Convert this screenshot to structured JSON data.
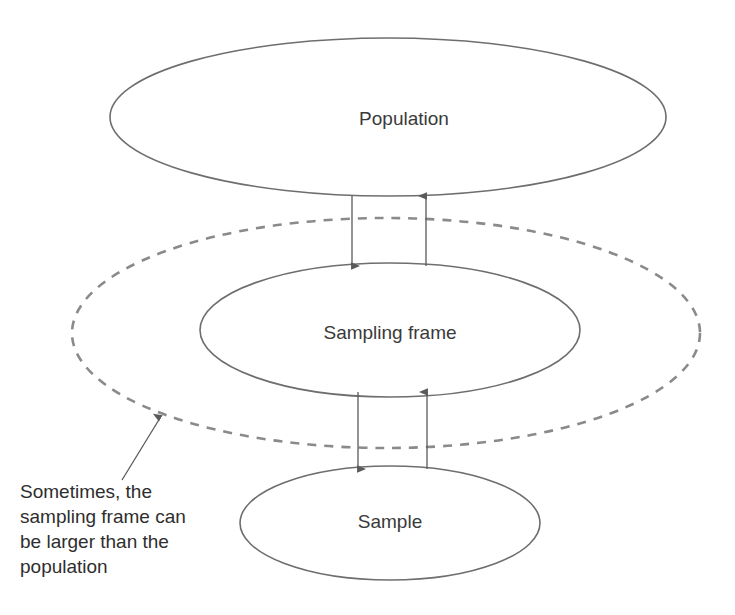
{
  "diagram": {
    "nodes": [
      {
        "id": "population",
        "label": "Population",
        "shape": "ellipse",
        "style": "solid",
        "cx": 388,
        "cy": 117,
        "rx": 278,
        "ry": 79,
        "label_x": 404,
        "label_y": 120
      },
      {
        "id": "sampling-frame-outer",
        "label": "",
        "shape": "ellipse",
        "style": "dashed",
        "cx": 386,
        "cy": 333,
        "rx": 314,
        "ry": 115,
        "label_x": 386,
        "label_y": 333
      },
      {
        "id": "sampling-frame",
        "label": "Sampling frame",
        "shape": "ellipse",
        "style": "solid",
        "cx": 390,
        "cy": 330,
        "rx": 190,
        "ry": 67,
        "label_x": 390,
        "label_y": 334
      },
      {
        "id": "sample",
        "label": "Sample",
        "shape": "ellipse",
        "style": "solid",
        "cx": 390,
        "cy": 523,
        "rx": 150,
        "ry": 57,
        "label_x": 390,
        "label_y": 523
      }
    ],
    "connectors": [
      {
        "id": "population-to-sampling-frame",
        "from": "population",
        "to": "sampling-frame",
        "direction": "down",
        "x": 352,
        "y_start": 196,
        "y_end": 266
      },
      {
        "id": "sampling-frame-to-population",
        "from": "sampling-frame",
        "to": "population",
        "direction": "up",
        "x": 426,
        "y_start": 266,
        "y_end": 196
      },
      {
        "id": "sampling-frame-to-sample",
        "from": "sampling-frame",
        "to": "sample",
        "direction": "down",
        "x": 358,
        "y_start": 392,
        "y_end": 469
      },
      {
        "id": "sample-to-sampling-frame",
        "from": "sample",
        "to": "sampling-frame",
        "direction": "up",
        "x": 427,
        "y_start": 469,
        "y_end": 392
      }
    ],
    "annotation": {
      "id": "sampling-frame-note",
      "lines": [
        "Sometimes, the",
        "sampling frame can",
        "be larger than the",
        "population"
      ],
      "text_x": 20,
      "text_first_line_y": 498,
      "line_height": 25,
      "pointer": {
        "x1": 122,
        "y1": 480,
        "x2": 160,
        "y2": 418
      }
    },
    "colors": {
      "background": "#ffffff",
      "solid_stroke": "#6e6e6e",
      "dashed_stroke": "#8a8a8a",
      "arrow_stroke": "#5a5a5a",
      "label_text": "#3a3a3a",
      "caption_text": "#2e2e2e"
    }
  }
}
